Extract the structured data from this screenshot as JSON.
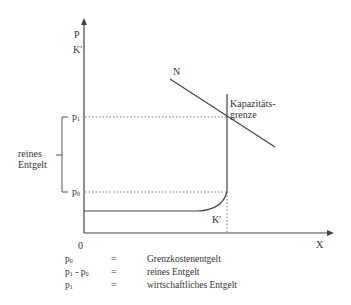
{
  "diagram": {
    "axes": {
      "y_label_1": "P",
      "y_label_2": "K'",
      "x_label": "X",
      "origin": "0"
    },
    "price_levels": [
      {
        "symbol": "p",
        "sub": "1"
      },
      {
        "symbol": "p",
        "sub": "0"
      }
    ],
    "curves": {
      "demand_label": "N",
      "cost_label": "K'",
      "capacity_label_1": "Kapazitäts-",
      "capacity_label_2": "grenze"
    },
    "brace_label_1": "reines",
    "brace_label_2": "Entgelt"
  },
  "legend": [
    {
      "symbol": "p",
      "sub": "0",
      "symbol2": "",
      "sub2": "",
      "eq": "=",
      "text": "Grenzkostenentgelt"
    },
    {
      "symbol": "p",
      "sub": "1",
      "symbol2": " - p",
      "sub2": "0",
      "eq": "=",
      "text": "reines Entgelt"
    },
    {
      "symbol": "p",
      "sub": "1",
      "symbol2": "",
      "sub2": "",
      "eq": "=",
      "text": "wirtschaftliches Entgelt"
    }
  ]
}
